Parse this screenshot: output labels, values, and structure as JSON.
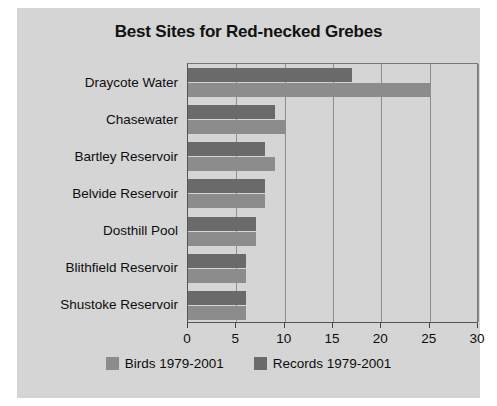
{
  "figure": {
    "background_color": "#d5d5d5",
    "page_background": "#ffffff"
  },
  "chart_data": {
    "type": "bar",
    "orientation": "horizontal",
    "title": "Best Sites for Red-necked Grebes",
    "xlabel": "",
    "ylabel": "",
    "xlim": [
      0,
      30
    ],
    "ylim": null,
    "grid": true,
    "grid_axis": "x",
    "legend_position": "bottom",
    "categories": [
      "Draycote Water",
      "Chasewater",
      "Bartley Reservoir",
      "Belvide Reservoir",
      "Dosthill Pool",
      "Blithfield Reservoir",
      "Shustoke Reservoir"
    ],
    "xticks": [
      0,
      5,
      10,
      15,
      20,
      25,
      30
    ],
    "xtick_labels": [
      "0",
      "5",
      "10",
      "15",
      "20",
      "25",
      "30"
    ],
    "series": [
      {
        "name": "Birds 1979-2001",
        "color": "#8c8c8c",
        "values": [
          25,
          10,
          9,
          8,
          7,
          6,
          6
        ]
      },
      {
        "name": "Records 1979-2001",
        "color": "#6a6a6a",
        "values": [
          17,
          9,
          8,
          8,
          7,
          6,
          6
        ]
      }
    ]
  },
  "legend": {
    "entries": [
      {
        "label": "Birds 1979-2001",
        "color": "#8c8c8c"
      },
      {
        "label": "Records 1979-2001",
        "color": "#6a6a6a"
      }
    ]
  }
}
